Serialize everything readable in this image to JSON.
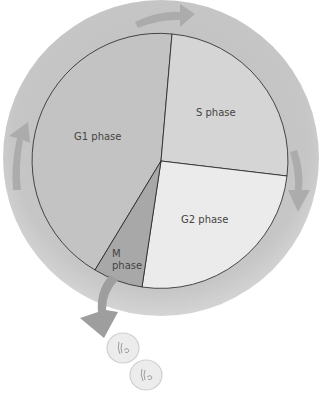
{
  "diagram": {
    "phases": [
      {
        "id": "g1",
        "label": "G1 phase",
        "color": "#c4c4c4"
      },
      {
        "id": "s",
        "label": "S phase",
        "color": "#d6d6d6"
      },
      {
        "id": "g2",
        "label": "G2 phase",
        "color": "#ebebeb"
      },
      {
        "id": "m",
        "label_line1": "M",
        "label_line2": "phase",
        "color": "#a9a9a9"
      }
    ],
    "ring_color": "#c8c8c8",
    "arrow_color": "#a8a8a8",
    "daughter_cells": [
      {
        "id": "cell-1"
      },
      {
        "id": "cell-2"
      }
    ]
  }
}
